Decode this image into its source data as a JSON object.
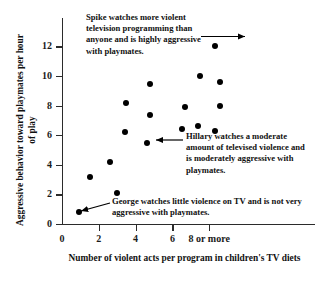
{
  "chart_data": {
    "type": "scatter",
    "title": "",
    "xlabel": "Number of violent acts per program in children's TV diets",
    "ylabel": "Aggressive behavior toward playmates per hour of play",
    "xlim": [
      0,
      9
    ],
    "ylim": [
      0,
      13
    ],
    "grid": false,
    "legend": "none",
    "xticks": [
      0,
      2,
      4,
      6,
      8
    ],
    "xtick_labels": [
      "0",
      "2",
      "4",
      "6",
      "8 or more"
    ],
    "yticks": [
      0,
      2,
      4,
      6,
      8,
      10,
      12
    ],
    "ytick_labels": [
      "0",
      "2",
      "4",
      "6",
      "8",
      "10",
      "12"
    ],
    "points": [
      {
        "x": 0.9,
        "y": 0.8,
        "label": "George"
      },
      {
        "x": 1.5,
        "y": 3.2,
        "label": ""
      },
      {
        "x": 2.6,
        "y": 4.2,
        "label": ""
      },
      {
        "x": 3.0,
        "y": 2.1,
        "label": ""
      },
      {
        "x": 3.4,
        "y": 6.2,
        "label": ""
      },
      {
        "x": 3.5,
        "y": 8.15,
        "label": ""
      },
      {
        "x": 4.6,
        "y": 5.5,
        "label": "Hillary"
      },
      {
        "x": 4.8,
        "y": 7.35,
        "label": ""
      },
      {
        "x": 4.8,
        "y": 9.45,
        "label": ""
      },
      {
        "x": 6.5,
        "y": 6.4,
        "label": ""
      },
      {
        "x": 6.7,
        "y": 7.9,
        "label": ""
      },
      {
        "x": 7.4,
        "y": 6.65,
        "label": ""
      },
      {
        "x": 7.5,
        "y": 10.0,
        "label": ""
      },
      {
        "x": 8.3,
        "y": 6.3,
        "label": ""
      },
      {
        "x": 8.3,
        "y": 12.0,
        "label": "Spike"
      },
      {
        "x": 8.6,
        "y": 7.95,
        "label": ""
      },
      {
        "x": 8.6,
        "y": 9.6,
        "label": ""
      }
    ],
    "annotations": [
      {
        "name": "spike",
        "text": "Spike watches more violent television programming than anyone and is highly aggressive with playmates.",
        "target_x": 8.3,
        "target_y": 12.0
      },
      {
        "name": "hillary",
        "text": "Hillary watches a moderate amount of televised violence and is moderately aggressive with playmates.",
        "target_x": 4.6,
        "target_y": 5.5
      },
      {
        "name": "george",
        "text": "George watches little violence on TV and is not very aggressive with playmates.",
        "target_x": 0.9,
        "target_y": 0.8
      }
    ],
    "colors": {
      "point": "#000000",
      "axis": "#2b2b2b",
      "text": "#111111",
      "background": "#ffffff"
    }
  }
}
